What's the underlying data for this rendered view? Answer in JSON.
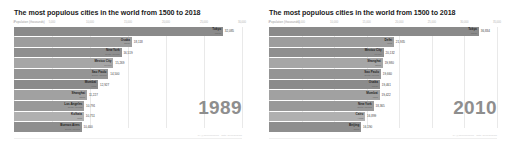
{
  "panels": [
    {
      "title": "The most populous cities in the world from 1500 to 2018",
      "subtitle": "Population (thousands)",
      "year": "1989",
      "attribution": "by @jburnmurdoch · data: demographia",
      "chart_data": {
        "type": "bar",
        "title": "The most populous cities in the world from 1500 to 2018",
        "subtitle": "Population (thousands)",
        "xlabel": "",
        "ylabel": "",
        "xlim": [
          0,
          35000
        ],
        "xticks": [
          "0",
          "5,000",
          "10,000",
          "15,000",
          "20,000",
          "25,000",
          "30,000"
        ],
        "grid": true,
        "legend": "none",
        "orientation": "horizontal",
        "annotation": "1989",
        "categories": [
          "Tokyo",
          "Osaka",
          "New York",
          "Mexico City",
          "Sao Paulo",
          "Mumbai",
          "Shanghai",
          "Los Angeles",
          "Kolkata",
          "Buenos Aires"
        ],
        "values": [
          32085,
          18118,
          16519,
          15269,
          14500,
          12927,
          11227,
          10791,
          10751,
          10400
        ],
        "value_labels": [
          "32,085",
          "18,118",
          "16,519",
          "15,269",
          "14,500",
          "12,927",
          "11,227",
          "10,791",
          "10,751",
          "10,400"
        ],
        "countries": [
          "Japan",
          "Japan",
          "North America",
          "Mexico",
          "South America",
          "India",
          "China",
          "North America",
          "India",
          "South America"
        ]
      }
    },
    {
      "title": "The most populous cities in the world from 1500 to 2018",
      "subtitle": "Population (thousands)",
      "year": "2010",
      "attribution": "by @jburnmurdoch · data: demographia",
      "chart_data": {
        "type": "bar",
        "title": "The most populous cities in the world from 1500 to 2018",
        "subtitle": "Population (thousands)",
        "xlabel": "",
        "ylabel": "",
        "xlim": [
          0,
          40000
        ],
        "xticks": [
          "0",
          "5,000",
          "10,000",
          "15,000",
          "20,000",
          "25,000",
          "30,000",
          "35,000"
        ],
        "grid": true,
        "legend": "none",
        "orientation": "horizontal",
        "annotation": "2010",
        "categories": [
          "Tokyo",
          "Delhi",
          "Mexico City",
          "Shanghai",
          "Sao Paulo",
          "Osaka",
          "Mumbai",
          "New York",
          "Cairo",
          "Beijing"
        ],
        "values": [
          36834,
          21935,
          20132,
          19980,
          19660,
          19461,
          19422,
          18365,
          16899,
          16190
        ],
        "value_labels": [
          "36,834",
          "21,935",
          "20,132",
          "19,980",
          "19,660",
          "19,461",
          "19,422",
          "18,365",
          "16,899",
          "16,190"
        ],
        "countries": [
          "Japan",
          "India",
          "Mexico",
          "China",
          "South America",
          "Japan",
          "India",
          "North America",
          "Africa",
          "China"
        ]
      }
    }
  ]
}
